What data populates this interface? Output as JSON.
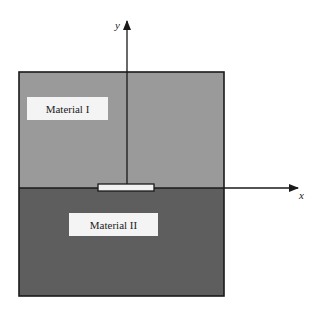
{
  "diagram": {
    "type": "bimaterial interface crack schematic",
    "colors": {
      "material_1": "#9a9a9a",
      "material_2": "#5e5e5e",
      "crack_fill": "#f2f2f2",
      "line": "#1a1a1a",
      "label_bg": "#f4f4f4"
    },
    "materials": [
      {
        "label": "Material I",
        "position": "upper half"
      },
      {
        "label": "Material II",
        "position": "lower half"
      }
    ],
    "axes": {
      "x_label": "x",
      "y_label": "y"
    },
    "crack": {
      "location": "along bimaterial interface, centered on y-axis"
    }
  }
}
